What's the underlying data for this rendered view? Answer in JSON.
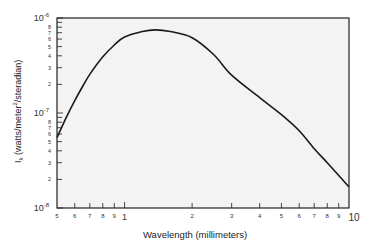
{
  "chart_data": {
    "type": "line",
    "title": "",
    "xlabel": "Wavelength (millimeters)",
    "ylabel_main": "I",
    "ylabel_sub": "λ",
    "ylabel_rest": " (watts/meter",
    "ylabel_sup": "2",
    "ylabel_end": "/steradian)",
    "xscale": "log",
    "yscale": "log",
    "xlim": [
      0.5,
      10
    ],
    "ylim": [
      1e-08,
      1e-06
    ],
    "grid": false,
    "x_major_ticks": [
      {
        "value": 1,
        "label": "1"
      },
      {
        "value": 10,
        "label": "10"
      }
    ],
    "x_minor_ticks": [
      {
        "value": 0.5,
        "label": "5"
      },
      {
        "value": 0.6,
        "label": "6"
      },
      {
        "value": 0.7,
        "label": "7"
      },
      {
        "value": 0.8,
        "label": "8"
      },
      {
        "value": 0.9,
        "label": "9"
      },
      {
        "value": 2,
        "label": "2"
      },
      {
        "value": 3,
        "label": "3"
      },
      {
        "value": 4,
        "label": "4"
      },
      {
        "value": 5,
        "label": "5"
      },
      {
        "value": 6,
        "label": "6"
      },
      {
        "value": 7,
        "label": "7"
      },
      {
        "value": 8,
        "label": "8"
      },
      {
        "value": 9,
        "label": "9"
      }
    ],
    "y_major_ticks": [
      {
        "value": 1e-06,
        "base": "10",
        "exp": "-6"
      },
      {
        "value": 1e-07,
        "base": "10",
        "exp": "-7"
      },
      {
        "value": 1e-08,
        "base": "10",
        "exp": "-8"
      }
    ],
    "y_minor_labels": [
      "2",
      "3",
      "4",
      "5",
      "6",
      "7",
      "8"
    ],
    "series": [
      {
        "name": "I_lambda",
        "x": [
          0.5,
          0.55,
          0.6,
          0.65,
          0.7,
          0.8,
          0.9,
          1.0,
          1.2,
          1.37,
          1.6,
          2.0,
          2.5,
          3.0,
          4.0,
          5.0,
          6.0,
          7.0,
          8.0,
          9.0,
          10.0
        ],
        "y": [
          5.5e-08,
          9e-08,
          1.35e-07,
          1.9e-07,
          2.55e-07,
          3.9e-07,
          5.2e-07,
          6.3e-07,
          7.2e-07,
          7.5e-07,
          7.2e-07,
          6.2e-07,
          4.1e-07,
          2.5e-07,
          1.45e-07,
          9.6e-08,
          6.5e-08,
          4.2e-08,
          3e-08,
          2.2e-08,
          1.66e-08
        ]
      }
    ],
    "colors": {
      "frame": "#222222",
      "line": "#1a1a1a",
      "plot_bg": "#f3f3f3"
    }
  }
}
